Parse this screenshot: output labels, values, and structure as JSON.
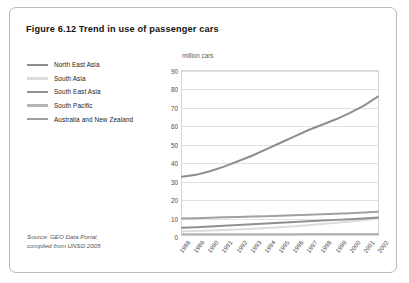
{
  "figure": {
    "title": "Figure 6.12 Trend in use of passenger cars",
    "source_note": "Source: GEO Data Portal,\ncompiled from UNSD 2005"
  },
  "legend": {
    "position": "left",
    "items": [
      {
        "label": "North East Asia",
        "color": "#8e8e8e"
      },
      {
        "label": "South Asia",
        "color": "#dcdcdc"
      },
      {
        "label": "South East Asia",
        "color": "#909090"
      },
      {
        "label": "South Pacific",
        "color": "#b4b4b4"
      },
      {
        "label": "Australia and New Zealand",
        "color": "#a0a0a0"
      }
    ]
  },
  "chart_data": {
    "type": "line",
    "title": "Figure 6.12 Trend in use of passenger cars",
    "xlabel": "",
    "ylabel": "million cars",
    "ylim": [
      0,
      90
    ],
    "yticks": [
      0,
      10,
      20,
      30,
      40,
      50,
      60,
      70,
      80,
      90
    ],
    "grid": true,
    "legend_position": "left",
    "x": [
      1988,
      1989,
      1990,
      1991,
      1992,
      1993,
      1994,
      1995,
      1996,
      1997,
      1998,
      1999,
      2000,
      2001,
      2002
    ],
    "categories": [
      "1988",
      "1989",
      "1990",
      "1991",
      "1992",
      "1993",
      "1994",
      "1995",
      "1996",
      "1997",
      "1998",
      "1999",
      "2000",
      "2001",
      "2002"
    ],
    "series": [
      {
        "name": "North East Asia",
        "color": "#8e8e8e",
        "values": [
          32,
          33,
          35,
          37.5,
          40.5,
          43.5,
          47,
          50.5,
          54,
          57.5,
          60.5,
          63.5,
          67,
          71,
          76
        ]
      },
      {
        "name": "South Asia",
        "color": "#dcdcdc",
        "values": [
          2.0,
          2.2,
          2.4,
          2.7,
          3.0,
          3.4,
          3.8,
          4.3,
          4.8,
          5.4,
          6.0,
          6.7,
          7.4,
          8.2,
          9.0
        ]
      },
      {
        "name": "South East Asia",
        "color": "#909090",
        "values": [
          4.0,
          4.3,
          4.7,
          5.1,
          5.5,
          5.9,
          6.3,
          6.7,
          7.1,
          7.5,
          7.9,
          8.3,
          8.7,
          9.1,
          9.6
        ]
      },
      {
        "name": "South Pacific",
        "color": "#b4b4b4",
        "values": [
          0.35,
          0.36,
          0.37,
          0.38,
          0.4,
          0.41,
          0.43,
          0.44,
          0.46,
          0.48,
          0.5,
          0.52,
          0.54,
          0.56,
          0.58
        ]
      },
      {
        "name": "Australia and New Zealand",
        "color": "#a0a0a0",
        "values": [
          9.0,
          9.2,
          9.5,
          9.7,
          9.9,
          10.1,
          10.3,
          10.5,
          10.8,
          11.1,
          11.4,
          11.7,
          12.0,
          12.4,
          12.8
        ]
      }
    ]
  }
}
